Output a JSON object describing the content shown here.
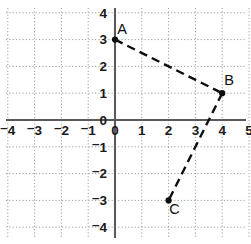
{
  "figure": {
    "kind": "coordinate-plane-scatter-with-segments",
    "background_color": "#ffffff"
  },
  "chart_data": {
    "type": "scatter",
    "title": "",
    "subtitle": "",
    "xlabel": "",
    "ylabel": "",
    "xlim": [
      -4.6,
      5.6
    ],
    "ylim": [
      -4.6,
      4.6
    ],
    "xticks": [
      -4,
      -3,
      -2,
      -1,
      0,
      1,
      2,
      3,
      4,
      5
    ],
    "yticks": [
      4,
      3,
      2,
      1,
      0,
      -1,
      -2,
      -3,
      -4
    ],
    "xtick_labels": [
      "⁻4",
      "⁻3",
      "⁻2",
      "⁻1",
      "0",
      "1",
      "2",
      "3",
      "4",
      "5"
    ],
    "ytick_labels": [
      "4",
      "3",
      "2",
      "1",
      "0",
      "⁻1",
      "⁻2",
      "⁻3",
      "⁻4"
    ],
    "grid": true,
    "grid_style": "dotted",
    "grid_color": "#8e8e8e",
    "axis_color": "#5a5a5a",
    "legend": null,
    "legend_position": "none",
    "points": [
      {
        "name": "A",
        "x": 0,
        "y": 3,
        "label": "A",
        "label_dx": 7,
        "label_dy": -6
      },
      {
        "name": "B",
        "x": 4,
        "y": 1,
        "label": "B",
        "label_dx": 7,
        "label_dy": -8
      },
      {
        "name": "C",
        "x": 2,
        "y": -3,
        "label": "C",
        "label_dx": 6,
        "label_dy": 14
      }
    ],
    "segments": [
      {
        "from": "A",
        "to": "B",
        "style": "dashed",
        "color": "#0d0d0d"
      },
      {
        "from": "B",
        "to": "C",
        "style": "dashed",
        "color": "#0d0d0d"
      }
    ],
    "annotations": [
      "A",
      "B",
      "C"
    ]
  },
  "geometry": {
    "origin_px": {
      "x": 115.0,
      "y": 120.0
    },
    "unit_px": 26.8,
    "grid_x_range": [
      -4,
      5
    ],
    "grid_y_range": [
      -4,
      4
    ],
    "axis_x_extent_px": [
      6,
      246
    ],
    "axis_y_extent_px": [
      8,
      238
    ]
  },
  "tick_label_offsets": {
    "x_label_dy": 15,
    "y_label_dx": -8
  }
}
